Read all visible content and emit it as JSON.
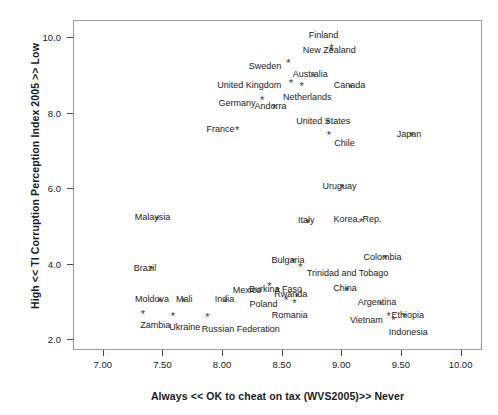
{
  "chart_data": {
    "type": "scatter",
    "title": "",
    "xlabel": "Always << OK to cheat on tax (WVS2005)>> Never",
    "ylabel": "High << TI Corruption Perception Index 2005 >> Low",
    "xlim": [
      6.75,
      10.18
    ],
    "ylim": [
      1.72,
      10.45
    ],
    "xticks": [
      "7.00",
      "7.50",
      "8.00",
      "8.50",
      "9.00",
      "9.50",
      "10.00"
    ],
    "xtick_values": [
      7.0,
      7.5,
      8.0,
      8.5,
      9.0,
      9.5,
      10.0
    ],
    "yticks": [
      "2.0",
      "4.0",
      "6.0",
      "8.0",
      "10.0"
    ],
    "ytick_values": [
      2.0,
      4.0,
      6.0,
      8.0,
      10.0
    ],
    "grid": false,
    "legend": null,
    "marker": "asterisk",
    "marker_color": "#3a3a3a",
    "points": [
      {
        "label": "Finland",
        "x": 8.92,
        "y": 9.62,
        "lx": -24,
        "ly": -22
      },
      {
        "label": "New Zealand",
        "x": 8.92,
        "y": 9.55,
        "lx": -30,
        "ly": -10
      },
      {
        "label": "Sweden",
        "x": 8.56,
        "y": 9.22,
        "lx": -41,
        "ly": -6
      },
      {
        "label": "Australia",
        "x": 8.77,
        "y": 8.86,
        "lx": -22,
        "ly": -12
      },
      {
        "label": "United Kingdom",
        "x": 8.58,
        "y": 8.7,
        "lx": -75,
        "ly": -7
      },
      {
        "label": "Netherlands",
        "x": 8.67,
        "y": 8.62,
        "lx": -20,
        "ly": 2
      },
      {
        "label": "Canada",
        "x": 9.08,
        "y": 8.57,
        "lx": -18,
        "ly": -12
      },
      {
        "label": "Germany",
        "x": 8.34,
        "y": 8.25,
        "lx": -45,
        "ly": -6
      },
      {
        "label": "Andorra",
        "x": 8.44,
        "y": 8.02,
        "lx": -21,
        "ly": -12
      },
      {
        "label": "United States",
        "x": 8.89,
        "y": 7.62,
        "lx": -33,
        "ly": -12
      },
      {
        "label": "Japan",
        "x": 9.59,
        "y": 7.28,
        "lx": -16,
        "ly": -12
      },
      {
        "label": "France",
        "x": 8.13,
        "y": 7.45,
        "lx": -32,
        "ly": -10
      },
      {
        "label": "Chile",
        "x": 8.9,
        "y": 7.31,
        "lx": 4,
        "ly": -2
      },
      {
        "label": "Uruguay",
        "x": 9.01,
        "y": 5.9,
        "lx": -21,
        "ly": -12
      },
      {
        "label": "Korea, Rep.",
        "x": 9.17,
        "y": 5.02,
        "lx": -29,
        "ly": -12
      },
      {
        "label": "Malaysia",
        "x": 7.46,
        "y": 5.07,
        "lx": -24,
        "ly": -12
      },
      {
        "label": "Italy",
        "x": 8.72,
        "y": 5.0,
        "lx": -11,
        "ly": -12
      },
      {
        "label": "Colombia",
        "x": 9.37,
        "y": 4.03,
        "lx": -23,
        "ly": -12
      },
      {
        "label": "Brazil",
        "x": 7.41,
        "y": 3.74,
        "lx": -19,
        "ly": -12
      },
      {
        "label": "Bulgaria",
        "x": 8.6,
        "y": 3.95,
        "lx": -23,
        "ly": -12
      },
      {
        "label": "Trinidad and Tobago",
        "x": 8.66,
        "y": 3.82,
        "lx": 5,
        "ly": -4
      },
      {
        "label": "Mexico",
        "x": 8.4,
        "y": 3.32,
        "lx": -38,
        "ly": -6
      },
      {
        "label": "Burkina Faso",
        "x": 8.47,
        "y": 3.18,
        "lx": -30,
        "ly": -12
      },
      {
        "label": "Rwanda",
        "x": 8.63,
        "y": 3.04,
        "lx": -24,
        "ly": -12
      },
      {
        "label": "China",
        "x": 9.05,
        "y": 3.2,
        "lx": -15,
        "ly": -12
      },
      {
        "label": "Moldova",
        "x": 7.48,
        "y": 2.9,
        "lx": -26,
        "ly": -12
      },
      {
        "label": "Mali",
        "x": 7.68,
        "y": 2.9,
        "lx": -9,
        "ly": -12
      },
      {
        "label": "India",
        "x": 8.03,
        "y": 2.91,
        "lx": -12,
        "ly": -12
      },
      {
        "label": "Poland",
        "x": 8.54,
        "y": 2.94,
        "lx": -38,
        "ly": -6
      },
      {
        "label": "Romania",
        "x": 8.61,
        "y": 2.87,
        "lx": -24,
        "ly": 2
      },
      {
        "label": "Argentina",
        "x": 9.33,
        "y": 2.83,
        "lx": -24,
        "ly": -12
      },
      {
        "label": "Zambia",
        "x": 7.34,
        "y": 2.58,
        "lx": -4,
        "ly": 2
      },
      {
        "label": "Ukraine",
        "x": 7.59,
        "y": 2.54,
        "lx": -5,
        "ly": 2
      },
      {
        "label": "Russian Federation",
        "x": 7.88,
        "y": 2.5,
        "lx": -7,
        "ly": 2
      },
      {
        "label": "Vietnam",
        "x": 9.4,
        "y": 2.52,
        "lx": -40,
        "ly": -6
      },
      {
        "label": "Ethiopia",
        "x": 9.53,
        "y": 2.5,
        "lx": -14,
        "ly": -12
      },
      {
        "label": "Indonesia",
        "x": 9.44,
        "y": 2.42,
        "lx": -6,
        "ly": 2
      }
    ]
  }
}
